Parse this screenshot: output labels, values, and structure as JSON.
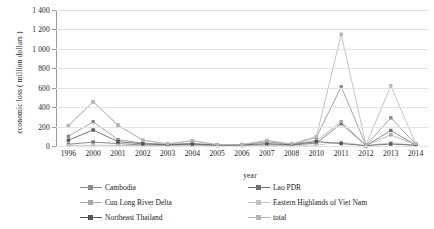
{
  "chart_data": {
    "type": "line",
    "title": "",
    "xlabel": "year",
    "ylabel": "economic loss ( million dollars )",
    "grid": true,
    "legend_position": "bottom",
    "ylim": [
      0,
      1400
    ],
    "yticks": [
      "0",
      "200",
      "400",
      "600",
      "800",
      "1 000",
      "1 200",
      "1 400"
    ],
    "ytick_values": [
      0,
      200,
      400,
      600,
      800,
      1000,
      1200,
      1400
    ],
    "categories": [
      "1996",
      "2000",
      "2001",
      "2002",
      "2003",
      "2004",
      "2005",
      "2006",
      "2007",
      "2008",
      "2010",
      "2011",
      "2012",
      "2013",
      "2014"
    ],
    "series": [
      {
        "name": "Cambodia",
        "color": "#8c8c8c",
        "marker": "square",
        "values": [
          100,
          250,
          65,
          30,
          18,
          28,
          10,
          12,
          45,
          15,
          90,
          610,
          8,
          290,
          20
        ]
      },
      {
        "name": "Lao PDR",
        "color": "#6e6e6e",
        "marker": "square",
        "values": [
          18,
          40,
          25,
          10,
          8,
          12,
          5,
          6,
          12,
          8,
          30,
          230,
          5,
          160,
          10
        ]
      },
      {
        "name": "Cuu Long River Delta",
        "color": "#a8a8a8",
        "marker": "square",
        "values": [
          210,
          455,
          215,
          60,
          22,
          55,
          12,
          15,
          55,
          20,
          55,
          250,
          6,
          115,
          14
        ]
      },
      {
        "name": "Eastern Highlands of Viet Nam",
        "color": "#c2c2c2",
        "marker": "square",
        "values": [
          5,
          8,
          6,
          4,
          3,
          5,
          3,
          3,
          6,
          4,
          10,
          40,
          3,
          35,
          5
        ]
      },
      {
        "name": "Northeast Thailand",
        "color": "#555555",
        "marker": "square",
        "values": [
          60,
          165,
          45,
          22,
          12,
          20,
          8,
          10,
          25,
          12,
          45,
          25,
          4,
          20,
          8
        ]
      },
      {
        "name": "total",
        "color": "#b5b5b5",
        "marker": "square",
        "values": [
          210,
          455,
          215,
          60,
          22,
          55,
          12,
          15,
          55,
          22,
          95,
          1150,
          10,
          620,
          25
        ]
      }
    ]
  }
}
